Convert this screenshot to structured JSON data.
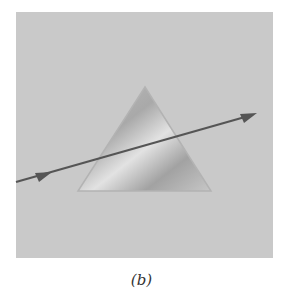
{
  "figure": {
    "caption": "(b)",
    "panel_color": "#c9c9c9",
    "prism": {
      "shape": "triangle",
      "apex": [
        145,
        87
      ],
      "base_left": [
        78,
        191
      ],
      "base_right": [
        211,
        191
      ],
      "edge_color": "#b3b3b3"
    },
    "ray": {
      "start": [
        16,
        182
      ],
      "end": [
        257,
        113
      ],
      "color": "#555555",
      "arrowheads": 2
    }
  }
}
